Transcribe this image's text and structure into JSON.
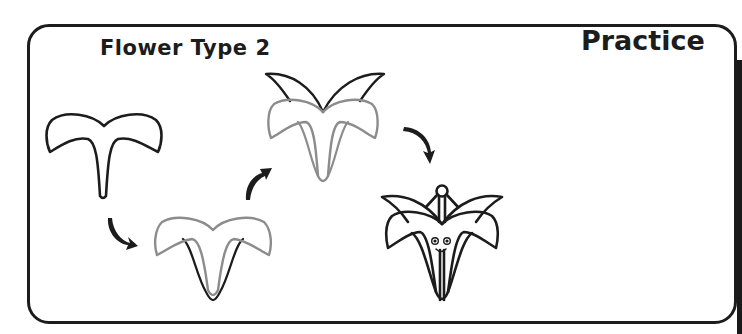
{
  "worksheet": {
    "title": "Flower Type 2",
    "mode_label": "Practice"
  },
  "colors": {
    "ink": "#1c1c1c",
    "guide_grey": "#8c8c8c",
    "background": "#ffffff"
  },
  "steps": [
    {
      "index": 1,
      "description": "Draw the first outline: two curved side petals joined at the top with a long narrow stem-petal hanging down",
      "stroke": "black"
    },
    {
      "index": 2,
      "description": "Previous shape shown in grey; add two inner petal tongues in black",
      "stroke": "grey+black"
    },
    {
      "index": 3,
      "description": "Previous flower shown in grey; add two pointed upper back petals in black",
      "stroke": "grey+black"
    },
    {
      "index": 4,
      "description": "Finished lily with stamen, eyes and smile",
      "stroke": "black"
    }
  ],
  "arrows": [
    {
      "from_step": 1,
      "to_step": 2,
      "direction": "down-right"
    },
    {
      "from_step": 2,
      "to_step": 3,
      "direction": "up-right"
    },
    {
      "from_step": 3,
      "to_step": 4,
      "direction": "down-right"
    }
  ]
}
